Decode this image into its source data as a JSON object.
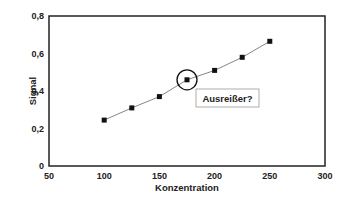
{
  "chart_data": {
    "type": "line",
    "title": "",
    "xlabel": "Konzentration",
    "ylabel": "Signal",
    "xlim": [
      50,
      300
    ],
    "ylim": [
      0,
      0.8
    ],
    "x_ticks": [
      "50",
      "100",
      "150",
      "200",
      "250",
      "300"
    ],
    "y_ticks": [
      "0",
      "0,2",
      "0,4",
      "0,6",
      "0,8"
    ],
    "grid": false,
    "legend": null,
    "series": [
      {
        "name": "Signal",
        "marker": "square",
        "x": [
          100,
          125,
          150,
          175,
          200,
          225,
          250
        ],
        "values": [
          0.245,
          0.31,
          0.37,
          0.46,
          0.51,
          0.58,
          0.665
        ]
      }
    ],
    "annotations": [
      {
        "text": "Ausreißer?",
        "target_x": 175,
        "target_y": 0.46,
        "style": "circled point with boxed label"
      }
    ]
  },
  "colors": {
    "line": "#777777",
    "marker": "#111111",
    "frame": "#222222"
  }
}
